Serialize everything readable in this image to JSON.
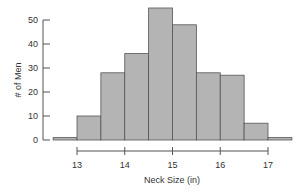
{
  "chart_data": {
    "type": "bar",
    "subtype": "histogram",
    "title": "",
    "xlabel": "Neck Size (in)",
    "ylabel": "# of Men",
    "bin_width": 0.5,
    "bins": [
      {
        "start": 12.5,
        "end": 13.0,
        "count": 1
      },
      {
        "start": 13.0,
        "end": 13.5,
        "count": 10
      },
      {
        "start": 13.5,
        "end": 14.0,
        "count": 28
      },
      {
        "start": 14.0,
        "end": 14.5,
        "count": 36
      },
      {
        "start": 14.5,
        "end": 15.0,
        "count": 55
      },
      {
        "start": 15.0,
        "end": 15.5,
        "count": 48
      },
      {
        "start": 15.5,
        "end": 16.0,
        "count": 28
      },
      {
        "start": 16.0,
        "end": 16.5,
        "count": 27
      },
      {
        "start": 16.5,
        "end": 17.0,
        "count": 7
      },
      {
        "start": 17.0,
        "end": 17.5,
        "count": 1
      }
    ],
    "categories": [
      "12.5-13",
      "13-13.5",
      "13.5-14",
      "14-14.5",
      "14.5-15",
      "15-15.5",
      "15.5-16",
      "16-16.5",
      "16.5-17",
      "17-17.5"
    ],
    "values": [
      1,
      10,
      28,
      36,
      55,
      48,
      28,
      27,
      7,
      1
    ],
    "x_ticks": [
      13,
      14,
      15,
      16,
      17
    ],
    "y_ticks": [
      0,
      10,
      20,
      30,
      40,
      50
    ],
    "xlim": [
      12.5,
      17.5
    ],
    "ylim": [
      0,
      55
    ],
    "grid": false,
    "legend": null,
    "bar_color": "#b4b4b4",
    "edge_color": "#555555"
  }
}
